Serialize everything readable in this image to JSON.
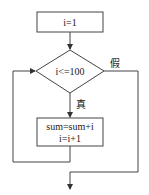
{
  "flowchart": {
    "init": "i=1",
    "condition": "i<=100",
    "true_label": "真",
    "false_label": "假",
    "body_line1": "sum=sum+i",
    "body_line2": "i=i+1"
  }
}
